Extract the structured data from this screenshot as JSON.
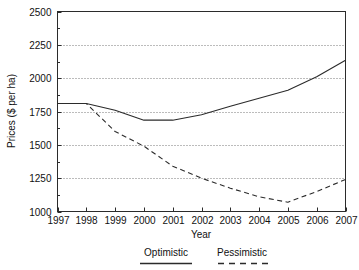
{
  "chart_data": {
    "type": "line",
    "title": "",
    "xlabel": "Year",
    "ylabel": "Prices ($ per ha)",
    "x": [
      1997,
      1998,
      1999,
      2000,
      2001,
      2002,
      2003,
      2004,
      2005,
      2006,
      2007
    ],
    "xticklabels": [
      "1997",
      "1998",
      "1999",
      "2000",
      "2001",
      "2002",
      "2003",
      "2004",
      "2005",
      "2006",
      "2007"
    ],
    "yticklabels": [
      "1000",
      "1250",
      "1500",
      "1750",
      "2000",
      "2250",
      "2500"
    ],
    "ytickvalues": [
      1000,
      1250,
      1500,
      1750,
      2000,
      2250,
      2500
    ],
    "ylim": [
      1000,
      2500
    ],
    "xlim": [
      1997,
      2007
    ],
    "grid": "horizontal-dotted",
    "legend_position": "below-axis",
    "series": [
      {
        "name": "Optimistic",
        "style": "solid",
        "color": "#2b2b2b",
        "values": [
          1810,
          1810,
          1760,
          1685,
          1685,
          1725,
          1790,
          1850,
          1910,
          2010,
          2135
        ]
      },
      {
        "name": "Pessimistic",
        "style": "dashed",
        "color": "#2b2b2b",
        "values": [
          1810,
          1810,
          1600,
          1490,
          1340,
          1250,
          1175,
          1110,
          1070,
          1150,
          1240
        ]
      }
    ],
    "minor_tick_step": 125
  },
  "legend": {
    "items": [
      {
        "label": "Optimistic",
        "style": "solid"
      },
      {
        "label": "Pessimistic",
        "style": "dashed"
      }
    ]
  }
}
